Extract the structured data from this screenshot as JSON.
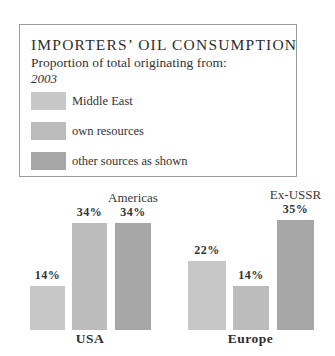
{
  "legend_box": {
    "title": "IMPORTERS’ OIL CONSUMPTION",
    "subtitle": "Proportion of total originating from:",
    "year": "2003",
    "items": [
      {
        "label": "Middle East",
        "color": "#c7c7c7"
      },
      {
        "label": "own resources",
        "color": "#bcbcbc"
      },
      {
        "label": "other sources as shown",
        "color": "#a7a7a7"
      }
    ]
  },
  "colors": {
    "middle_east": "#c7c7c7",
    "own_resources": "#bcbcbc",
    "other_sources": "#a7a7a7",
    "border": "#9b9b9b"
  },
  "chart_data": {
    "type": "bar",
    "unit": "%",
    "px_per_percent": 3.15,
    "legend_position": "top-box",
    "grid": false,
    "series_order": [
      "Middle East",
      "own resources",
      "other sources as shown"
    ],
    "groups": [
      {
        "name": "USA",
        "bars": [
          {
            "series": "Middle East",
            "value": 14,
            "label": "14%",
            "source_label": "",
            "color": "#c7c7c7"
          },
          {
            "series": "own resources",
            "value": 34,
            "label": "34%",
            "source_label": "",
            "color": "#bcbcbc"
          },
          {
            "series": "other sources",
            "value": 34,
            "label": "34%",
            "source_label": "Americas",
            "color": "#a7a7a7"
          }
        ]
      },
      {
        "name": "Europe",
        "bars": [
          {
            "series": "Middle East",
            "value": 22,
            "label": "22%",
            "source_label": "",
            "color": "#c7c7c7"
          },
          {
            "series": "own resources",
            "value": 14,
            "label": "14%",
            "source_label": "",
            "color": "#bcbcbc"
          },
          {
            "series": "other sources",
            "value": 35,
            "label": "35%",
            "source_label": "Ex-USSR",
            "color": "#a7a7a7"
          }
        ]
      }
    ]
  }
}
